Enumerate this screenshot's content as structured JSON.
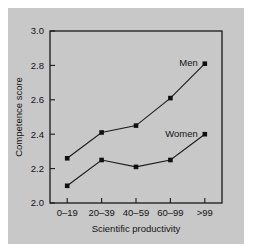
{
  "figure": {
    "background_color": "#c8c8c8",
    "page_background_color": "#ffffff",
    "frame_color": "#1a1a1a"
  },
  "chart_data": {
    "type": "line",
    "title": "",
    "xlabel": "Scientific productivity",
    "ylabel": "Competence score",
    "categories": [
      "0–19",
      "20–39",
      "40–59",
      "60–99",
      ">99"
    ],
    "ylim": [
      2.0,
      3.0
    ],
    "yticks": [
      2.0,
      2.2,
      2.4,
      2.6,
      2.8,
      3.0
    ],
    "ytick_labels": [
      "2.0",
      "2.2",
      "2.4",
      "2.6",
      "2.8",
      "3.0"
    ],
    "grid": false,
    "legend_position": "inline-labels",
    "series": [
      {
        "name": "Men",
        "label": "Men",
        "values": [
          2.26,
          2.41,
          2.45,
          2.61,
          2.81
        ],
        "color": "#101010",
        "marker": "square"
      },
      {
        "name": "Women",
        "label": "Women",
        "values": [
          2.1,
          2.25,
          2.21,
          2.25,
          2.4
        ],
        "color": "#101010",
        "marker": "square"
      }
    ],
    "annotations": [
      {
        "text": "Men",
        "series": "Men",
        "near_category": ">99"
      },
      {
        "text": "Women",
        "series": "Women",
        "near_category": ">99"
      }
    ]
  }
}
